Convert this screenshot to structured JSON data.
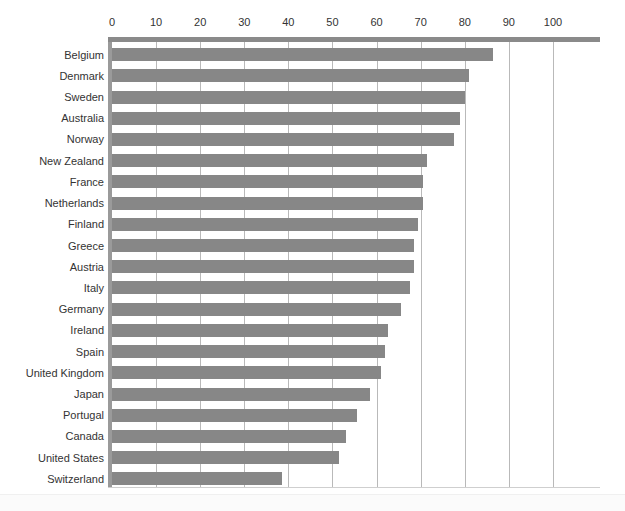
{
  "figure": {
    "caption_remnant": "",
    "background_color": "#ffffff",
    "bar_color": "#878787",
    "gridline_color": "#b9b9b9",
    "axis_rule_color": "#8a8a8a",
    "text_color": "#333333"
  },
  "chart_data": {
    "type": "bar",
    "orientation": "horizontal",
    "title": "",
    "subtitle": "",
    "xlabel": "",
    "ylabel": "",
    "xlim": [
      0,
      105
    ],
    "ylim": null,
    "grid": true,
    "legend": null,
    "legend_position": "none",
    "xticks": [
      0,
      10,
      20,
      30,
      40,
      50,
      60,
      70,
      80,
      90,
      100
    ],
    "xticklabels": [
      "0",
      "10",
      "20",
      "30",
      "40",
      "50",
      "60",
      "70",
      "80",
      "90",
      "100"
    ],
    "categories": [
      "Belgium",
      "Denmark",
      "Sweden",
      "Australia",
      "Norway",
      "New Zealand",
      "France",
      "Netherlands",
      "Finland",
      "Greece",
      "Austria",
      "Italy",
      "Germany",
      "Ireland",
      "Spain",
      "United Kingdom",
      "Japan",
      "Portugal",
      "Canada",
      "United States",
      "Switzerland"
    ],
    "values": [
      86.5,
      81.0,
      80.0,
      79.0,
      77.5,
      71.5,
      70.5,
      70.5,
      69.5,
      68.5,
      68.5,
      67.5,
      65.5,
      62.5,
      62.0,
      61.0,
      58.5,
      55.5,
      53.0,
      51.5,
      38.5
    ]
  }
}
